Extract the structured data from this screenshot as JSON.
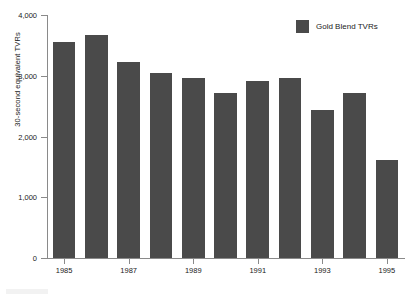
{
  "chart_data": {
    "type": "bar",
    "title": "",
    "xlabel": "",
    "ylabel": "30-second equivalent TVRs",
    "categories": [
      "1985",
      "1986",
      "1987",
      "1988",
      "1989",
      "1990",
      "1991",
      "1992",
      "1993",
      "1994",
      "1995"
    ],
    "values": [
      3560,
      3670,
      3230,
      3050,
      2960,
      2710,
      2910,
      2960,
      2430,
      2710,
      1620
    ],
    "series": [
      {
        "name": "Gold Blend TVRs",
        "color": "#4a4a4a",
        "values": [
          3560,
          3670,
          3230,
          3050,
          2960,
          2710,
          2910,
          2960,
          2430,
          2710,
          1620
        ]
      }
    ],
    "ylim": [
      0,
      4000
    ],
    "ytick_values": [
      0,
      1000,
      2000,
      3000,
      4000
    ],
    "ytick_labels": [
      "0",
      "1,000",
      "2,000",
      "3,000",
      "4,000"
    ],
    "xtick_labels": [
      "1985",
      "1987",
      "1989",
      "1991",
      "1993",
      "1995"
    ],
    "xtick_indices": [
      0,
      2,
      4,
      6,
      8,
      10
    ],
    "grid": false,
    "legend_position": "top-right"
  },
  "legend": {
    "entries": [
      {
        "label": "Gold Blend TVRs",
        "color": "#4a4a4a"
      }
    ]
  },
  "axes": {
    "y_title": "30-second equivalent TVRs"
  },
  "colors": {
    "bar": "#4a4a4a",
    "axis": "#8a8a8a",
    "text": "#1a1a1a",
    "background": "#ffffff"
  },
  "title_sliver": ""
}
